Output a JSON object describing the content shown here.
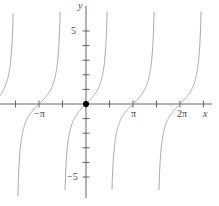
{
  "chart_data": {
    "type": "line",
    "title": "",
    "subtitle": "",
    "function": "y = tan(x)",
    "xlabel": "x",
    "ylabel": "y",
    "xlim": [
      -7.33,
      9.1
    ],
    "ylim": [
      -6.5,
      6.9
    ],
    "grid": false,
    "legend": null,
    "xticks": [
      -6.283,
      -4.712,
      -3.142,
      -1.571,
      0,
      1.571,
      3.142,
      4.712,
      6.283,
      7.854
    ],
    "xtick_labels": [
      "",
      "",
      "−π",
      "",
      "",
      "",
      "π",
      "",
      "2π",
      ""
    ],
    "yticks": [
      -5,
      -4,
      -3,
      -2,
      -1,
      1,
      2,
      3,
      4,
      5
    ],
    "ytick_labels": [
      "−5",
      "",
      "",
      "",
      "",
      "",
      "",
      "",
      "",
      "5"
    ],
    "asymptotes": [
      -4.712,
      -1.571,
      1.571,
      4.712,
      7.854
    ],
    "marked_points": [
      {
        "x": 0,
        "y": 0,
        "style": "filled-dot"
      }
    ],
    "series": [
      {
        "name": "tan(x)",
        "color": "#9a9a9a",
        "branches": [
          {
            "center": -6.283,
            "from": -7.33,
            "to": -4.712
          },
          {
            "center": -3.142,
            "from": -4.712,
            "to": -1.571
          },
          {
            "center": 0,
            "from": -1.571,
            "to": 1.571
          },
          {
            "center": 3.142,
            "from": 1.571,
            "to": 4.712
          },
          {
            "center": 6.283,
            "from": 4.712,
            "to": 7.854
          }
        ]
      }
    ]
  },
  "axes": {
    "x_axis_name": "x",
    "y_axis_name": "y"
  },
  "labels": {
    "neg_pi": "−π",
    "pi": "π",
    "two_pi": "2π",
    "five": "5",
    "neg_five": "−5"
  },
  "style": {
    "background": "#ffffff",
    "axis_color": "#555555",
    "curve_color": "#9a9a9a",
    "text_color": "#4a4a4a",
    "point_color": "#000000"
  }
}
